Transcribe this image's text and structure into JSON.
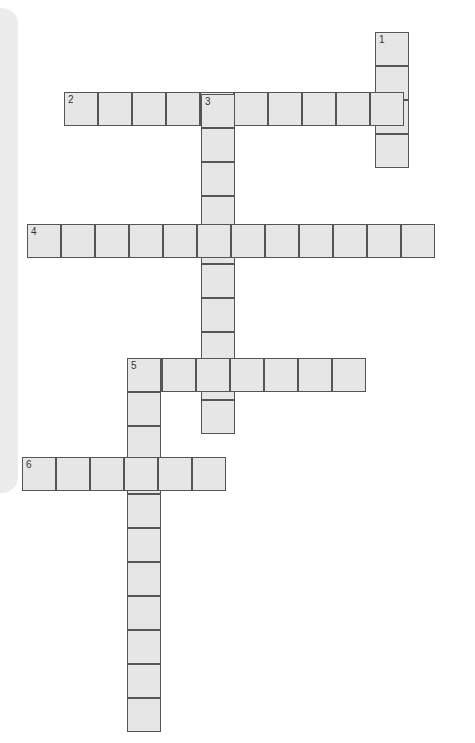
{
  "puzzle": {
    "cell_size": 34,
    "words": [
      {
        "number": "1",
        "direction": "down",
        "length": 4,
        "x": 375,
        "y": 32
      },
      {
        "number": "2",
        "direction": "across",
        "length": 10,
        "x": 64,
        "y": 92
      },
      {
        "number": "3",
        "direction": "down",
        "length": 10,
        "x": 201,
        "y": 94
      },
      {
        "number": "4",
        "direction": "across",
        "length": 12,
        "x": 27,
        "y": 224
      },
      {
        "number": "5",
        "direction": "across",
        "length": 7,
        "x": 128,
        "y": 358
      },
      {
        "number": "5",
        "direction": "down",
        "length": 11,
        "x": 127,
        "y": 358
      },
      {
        "number": "6",
        "direction": "across",
        "length": 6,
        "x": 22,
        "y": 457
      }
    ],
    "colors": {
      "cell_fill": "#e6e6e6",
      "cell_border": "#555555",
      "panel": "#ececec"
    }
  }
}
